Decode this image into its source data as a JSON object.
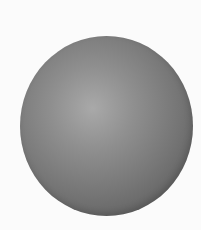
{
  "image": {
    "subject": "gray shaded sphere",
    "background_color": "#fbfbfb",
    "sphere": {
      "highlight_color": "#a9a9a9",
      "mid_color": "#7a7a7a",
      "edge_color": "#555555"
    }
  }
}
